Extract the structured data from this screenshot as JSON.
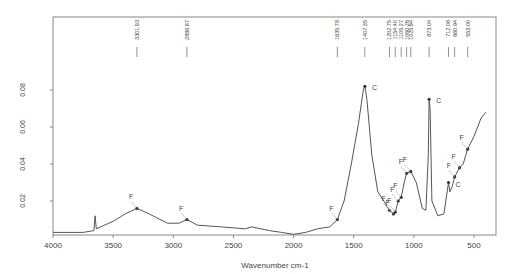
{
  "chart_data": {
    "type": "line",
    "title": "",
    "xlabel": "Wavenumber cm-1",
    "ylabel": "",
    "xlim": [
      4000,
      400
    ],
    "ylim": [
      0,
      0.09
    ],
    "x_ticks": [
      4000,
      3500,
      3000,
      2500,
      2000,
      1500,
      1000,
      500
    ],
    "y_ticks": [
      0.02,
      0.04,
      0.06,
      0.08
    ],
    "y_tick_labels": [
      "0.02",
      "0.04",
      "0.06",
      "0.08"
    ],
    "grid": false,
    "peak_labels": [
      "3301.93",
      "2886.87",
      "1635.78",
      "1407.35",
      "1202.75",
      "1154.40",
      "1105.27",
      "1060.26",
      "1025.94",
      "873.04",
      "712.08",
      "660.94",
      "553.00"
    ],
    "series": [
      {
        "name": "spectrum",
        "points": [
          [
            4000,
            0.003
          ],
          [
            3750,
            0.003
          ],
          [
            3660,
            0.004
          ],
          [
            3650,
            0.012
          ],
          [
            3640,
            0.005
          ],
          [
            3500,
            0.009
          ],
          [
            3400,
            0.013
          ],
          [
            3302,
            0.016
          ],
          [
            3200,
            0.013
          ],
          [
            3050,
            0.008
          ],
          [
            2950,
            0.008
          ],
          [
            2887,
            0.01
          ],
          [
            2800,
            0.007
          ],
          [
            2600,
            0.006
          ],
          [
            2400,
            0.005
          ],
          [
            2350,
            0.006
          ],
          [
            2200,
            0.004
          ],
          [
            2100,
            0.003
          ],
          [
            2000,
            0.002
          ],
          [
            1900,
            0.003
          ],
          [
            1800,
            0.005
          ],
          [
            1700,
            0.006
          ],
          [
            1636,
            0.01
          ],
          [
            1580,
            0.02
          ],
          [
            1520,
            0.04
          ],
          [
            1460,
            0.062
          ],
          [
            1420,
            0.08
          ],
          [
            1407,
            0.082
          ],
          [
            1390,
            0.075
          ],
          [
            1350,
            0.045
          ],
          [
            1300,
            0.025
          ],
          [
            1250,
            0.02
          ],
          [
            1203,
            0.015
          ],
          [
            1170,
            0.013
          ],
          [
            1154,
            0.014
          ],
          [
            1130,
            0.02
          ],
          [
            1105,
            0.022
          ],
          [
            1080,
            0.03
          ],
          [
            1060,
            0.035
          ],
          [
            1026,
            0.036
          ],
          [
            980,
            0.03
          ],
          [
            930,
            0.016
          ],
          [
            900,
            0.015
          ],
          [
            880,
            0.045
          ],
          [
            873,
            0.075
          ],
          [
            865,
            0.07
          ],
          [
            850,
            0.02
          ],
          [
            800,
            0.012
          ],
          [
            750,
            0.013
          ],
          [
            712,
            0.03
          ],
          [
            700,
            0.025
          ],
          [
            680,
            0.028
          ],
          [
            661,
            0.033
          ],
          [
            620,
            0.038
          ],
          [
            590,
            0.04
          ],
          [
            553,
            0.048
          ],
          [
            500,
            0.055
          ],
          [
            440,
            0.065
          ],
          [
            400,
            0.068
          ]
        ]
      }
    ],
    "annotations": [
      {
        "x": 3302,
        "text": "F"
      },
      {
        "x": 2887,
        "text": "F"
      },
      {
        "x": 1636,
        "text": "F"
      },
      {
        "x": 1407,
        "text": "C"
      },
      {
        "x": 1203,
        "text": "F"
      },
      {
        "x": 1170,
        "text": "F"
      },
      {
        "x": 1154,
        "text": "F"
      },
      {
        "x": 1130,
        "text": "F"
      },
      {
        "x": 1105,
        "text": "F"
      },
      {
        "x": 1060,
        "text": "F"
      },
      {
        "x": 1026,
        "text": "F"
      },
      {
        "x": 873,
        "text": "C"
      },
      {
        "x": 712,
        "text": "C"
      },
      {
        "x": 661,
        "text": "F"
      },
      {
        "x": 620,
        "text": "F"
      },
      {
        "x": 553,
        "text": "F"
      }
    ]
  }
}
